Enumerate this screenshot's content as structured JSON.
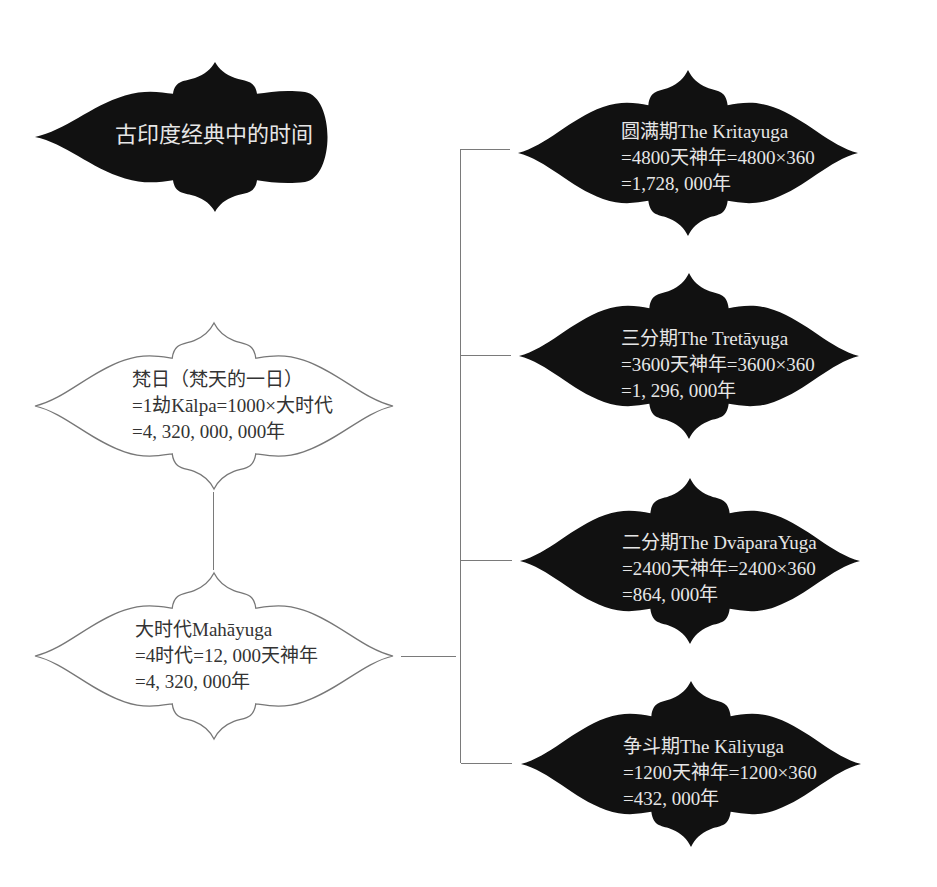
{
  "title": {
    "label": "古印度经典中的时间"
  },
  "left_nodes": [
    {
      "id": "brahma-day",
      "lines": [
        "梵日（梵天的一日）",
        "=1劫Kālpa=1000×大时代",
        "=4, 320, 000, 000年"
      ]
    },
    {
      "id": "mahayuga",
      "lines": [
        "大时代Mahāyuga",
        "=4时代=12, 000天神年",
        "=4, 320, 000年"
      ]
    }
  ],
  "right_nodes": [
    {
      "id": "kritayuga",
      "lines": [
        "圆满期The Kritayuga",
        "=4800天神年=4800×360",
        "=1,728, 000年"
      ]
    },
    {
      "id": "tretayuga",
      "lines": [
        "三分期The Tretāyuga",
        "=3600天神年=3600×360",
        "=1, 296, 000年"
      ]
    },
    {
      "id": "dvaparayuga",
      "lines": [
        "二分期The DvāparaYuga",
        "=2400天神年=2400×360",
        "=864, 000年"
      ]
    },
    {
      "id": "kaliyuga",
      "lines": [
        "争斗期The Kāliyuga",
        "=1200天神年=1200×360",
        "=432, 000年"
      ]
    }
  ],
  "colors": {
    "dark_fill": "#111111",
    "light_fill": "#ffffff",
    "outline": "#777777",
    "connector": "#7a7a7a",
    "dark_text": "#e6e6e6",
    "light_text": "#333333"
  }
}
